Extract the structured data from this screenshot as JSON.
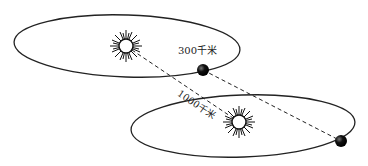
{
  "diagram": {
    "labels": {
      "orbit_radius": "300千米",
      "distance": "1000千米"
    },
    "elements": {
      "top_orbit": {
        "cx": 127,
        "cy": 46,
        "rx": 113,
        "ry": 31
      },
      "bottom_orbit": {
        "cx": 243,
        "cy": 126,
        "rx": 112,
        "ry": 31
      },
      "top_sun": {
        "cx": 126,
        "cy": 46
      },
      "bottom_sun": {
        "cx": 239,
        "cy": 122
      },
      "top_planet": {
        "cx": 203,
        "cy": 70,
        "r": 6
      },
      "bottom_planet": {
        "cx": 341,
        "cy": 141,
        "r": 6
      }
    },
    "colors": {
      "line": "#222222",
      "planet": "#111111",
      "background": "#ffffff"
    }
  }
}
